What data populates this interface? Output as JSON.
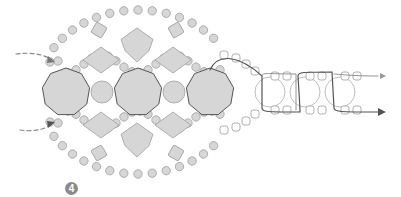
{
  "diagram": {
    "step_number": "4",
    "colors": {
      "bead_fill": "#d6d6d6",
      "bead_stroke": "#a0a0a0",
      "large_bead_stroke": "#555555",
      "thread_dark": "#555555",
      "thread_light": "#b5b5b5",
      "outline_bead_stroke": "#9a9a9a",
      "arrow": "#555555"
    },
    "large_octagons": [
      {
        "cx": 66,
        "cy": 92,
        "r": 24
      },
      {
        "cx": 138,
        "cy": 92,
        "r": 24
      },
      {
        "cx": 210,
        "cy": 92,
        "r": 24
      }
    ],
    "round_beads_medium": [
      {
        "cx": 102,
        "cy": 92,
        "r": 11
      },
      {
        "cx": 174,
        "cy": 92,
        "r": 11
      }
    ],
    "diamonds": [
      {
        "cx": 137,
        "cy": 45,
        "w": 32,
        "h": 34
      },
      {
        "cx": 101,
        "cy": 60,
        "w": 36,
        "h": 26
      },
      {
        "cx": 173,
        "cy": 60,
        "w": 36,
        "h": 26
      },
      {
        "cx": 101,
        "cy": 125,
        "w": 36,
        "h": 26
      },
      {
        "cx": 173,
        "cy": 125,
        "w": 36,
        "h": 26
      },
      {
        "cx": 137,
        "cy": 140,
        "w": 32,
        "h": 34
      }
    ],
    "small_squares": [
      {
        "cx": 99,
        "cy": 30,
        "s": 12,
        "rot": 30
      },
      {
        "cx": 176,
        "cy": 30,
        "s": 12,
        "rot": -30
      },
      {
        "cx": 99,
        "cy": 153,
        "s": 12,
        "rot": -30
      },
      {
        "cx": 176,
        "cy": 153,
        "s": 12,
        "rot": 30
      }
    ],
    "pathways": {
      "right_links": [
        {
          "cx": 270,
          "cy": 92,
          "r": 15
        },
        {
          "cx": 305,
          "cy": 92,
          "r": 15
        },
        {
          "cx": 340,
          "cy": 92,
          "r": 15
        }
      ]
    }
  }
}
